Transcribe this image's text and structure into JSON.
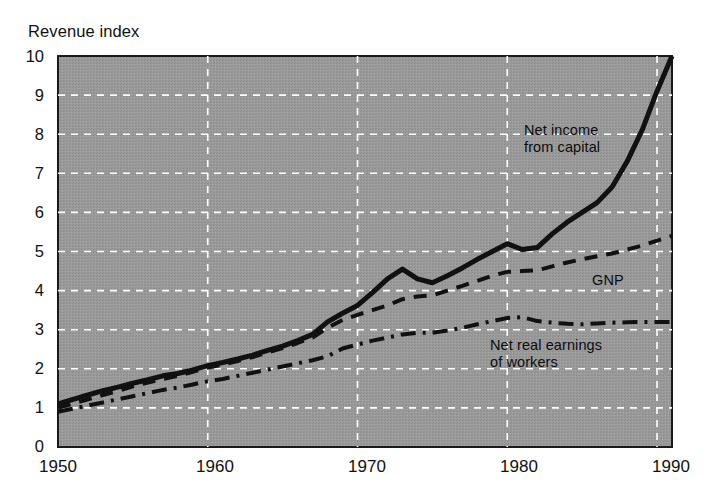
{
  "chart_data": {
    "type": "line",
    "title": "Revenue index",
    "xlabel": "",
    "ylabel": "Revenue index",
    "xlim": [
      1950,
      1991
    ],
    "ylim": [
      0,
      10
    ],
    "grid": true,
    "legend_position": "inline-annotations",
    "background_color": "#969696",
    "line_color": "#111111",
    "gridline_color": "#ffffff",
    "x_ticks": [
      "1950",
      "1960",
      "1970",
      "1980",
      "1990"
    ],
    "x_tick_values": [
      1950,
      1960,
      1970,
      1980,
      1990
    ],
    "y_ticks": [
      "0",
      "1",
      "2",
      "3",
      "4",
      "5",
      "6",
      "7",
      "8",
      "9",
      "10"
    ],
    "y_tick_values": [
      0,
      1,
      2,
      3,
      4,
      5,
      6,
      7,
      8,
      9,
      10
    ],
    "x": [
      1950,
      1951,
      1952,
      1953,
      1954,
      1955,
      1956,
      1957,
      1958,
      1959,
      1960,
      1961,
      1962,
      1963,
      1964,
      1965,
      1966,
      1967,
      1968,
      1969,
      1970,
      1971,
      1972,
      1973,
      1974,
      1975,
      1976,
      1977,
      1978,
      1979,
      1980,
      1981,
      1982,
      1983,
      1984,
      1985,
      1986,
      1987,
      1988,
      1989,
      1990,
      1991
    ],
    "series": [
      {
        "name": "Net income from capital",
        "style": "solid",
        "width": 5,
        "label_text": "Net income\nfrom capital",
        "values": [
          1.1,
          1.22,
          1.33,
          1.44,
          1.53,
          1.63,
          1.72,
          1.82,
          1.88,
          1.97,
          2.08,
          2.16,
          2.25,
          2.35,
          2.47,
          2.58,
          2.72,
          2.88,
          3.2,
          3.42,
          3.62,
          3.95,
          4.3,
          4.55,
          4.3,
          4.2,
          4.38,
          4.58,
          4.8,
          5.0,
          5.2,
          5.05,
          5.1,
          5.45,
          5.75,
          6.0,
          6.25,
          6.65,
          7.3,
          8.1,
          9.1,
          10.0
        ]
      },
      {
        "name": "GNP",
        "style": "dashed",
        "width": 4,
        "label_text": "GNP",
        "values": [
          1.0,
          1.11,
          1.22,
          1.33,
          1.43,
          1.55,
          1.65,
          1.74,
          1.82,
          1.92,
          2.03,
          2.11,
          2.2,
          2.3,
          2.42,
          2.53,
          2.66,
          2.8,
          3.05,
          3.25,
          3.38,
          3.5,
          3.62,
          3.78,
          3.85,
          3.88,
          4.0,
          4.12,
          4.25,
          4.38,
          4.48,
          4.5,
          4.52,
          4.62,
          4.72,
          4.8,
          4.88,
          4.95,
          5.05,
          5.15,
          5.28,
          5.4
        ]
      },
      {
        "name": "Net real earnings of workers",
        "style": "dashdot",
        "width": 4,
        "label_text": "Net real earnings\nof workers",
        "values": [
          0.9,
          0.98,
          1.06,
          1.14,
          1.22,
          1.3,
          1.38,
          1.46,
          1.52,
          1.6,
          1.68,
          1.74,
          1.82,
          1.9,
          1.98,
          2.06,
          2.14,
          2.22,
          2.32,
          2.52,
          2.62,
          2.72,
          2.8,
          2.88,
          2.92,
          2.92,
          2.98,
          3.05,
          3.14,
          3.22,
          3.3,
          3.32,
          3.22,
          3.18,
          3.15,
          3.14,
          3.16,
          3.18,
          3.19,
          3.2,
          3.2,
          3.2
        ]
      }
    ]
  }
}
